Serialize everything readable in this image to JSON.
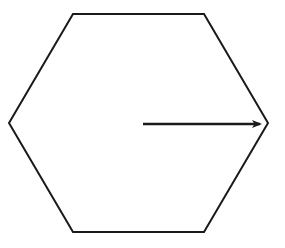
{
  "diagram": {
    "type": "geometry",
    "shape": "regular-hexagon",
    "stroke_color": "#1a1a1a",
    "background_color": "#ffffff",
    "hexagon": {
      "vertices": [
        [
          73,
          14
        ],
        [
          204,
          14
        ],
        [
          268,
          123
        ],
        [
          204,
          232
        ],
        [
          73,
          232
        ],
        [
          9,
          123
        ]
      ],
      "stroke_width": 2
    },
    "arrow": {
      "label": "",
      "from": [
        143,
        124
      ],
      "to": [
        260,
        124
      ],
      "stroke_width": 2.5,
      "meaning": "radius from center to right vertex"
    }
  }
}
